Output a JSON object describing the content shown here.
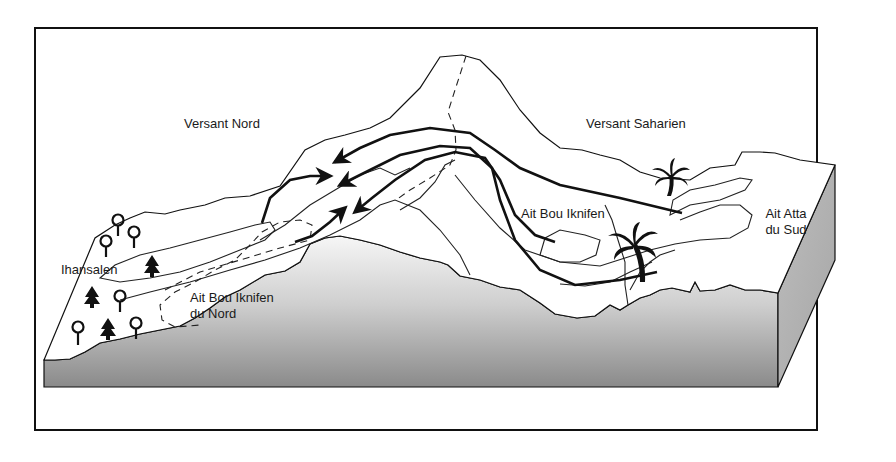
{
  "diagram": {
    "type": "block-diagram",
    "frame_color": "#111111",
    "terrain_side_gradient": [
      "#f4f4f4",
      "#8c8c8c"
    ],
    "labels": {
      "versant_nord": "Versant Nord",
      "versant_saharien": "Versant Saharien",
      "ait_bou_iknifen": "Ait Bou Iknifen",
      "ait_atta_line1": "Ait Atta",
      "ait_atta_line2": "du Sud",
      "ihansalen": "Ihansalen",
      "ait_bou_iknifen_nord_line1": "Ait Bou Iknifen",
      "ait_bou_iknifen_nord_line2": "du Nord"
    },
    "icons": {
      "deciduous_trees": 7,
      "conifer_trees": 3,
      "palm_trees": 2
    },
    "routes": [
      {
        "from": "Ait Atta du Sud",
        "to": "Versant Nord",
        "direction": "north"
      },
      {
        "from": "Versant Saharien",
        "to": "Versant Nord",
        "direction": "north"
      },
      {
        "from": "Ait Bou Iknifen",
        "to": "Versant Nord",
        "direction": "north"
      },
      {
        "from": "Ihansalen",
        "to": "summer pastures",
        "direction": "east"
      },
      {
        "from": "Ait Bou Iknifen du Nord",
        "to": "summer pastures",
        "direction": "east"
      }
    ]
  }
}
